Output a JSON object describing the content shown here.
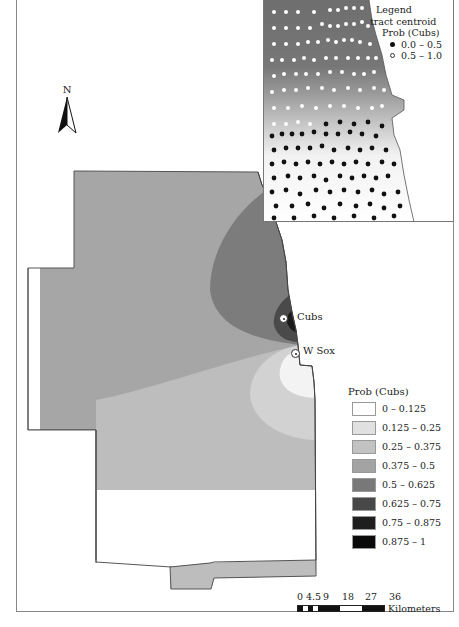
{
  "map": {
    "north_arrow": {
      "label": "N",
      "icon": "north-arrow-icon"
    },
    "stadiums": [
      {
        "name": "Cubs",
        "x": 284,
        "y": 319
      },
      {
        "name": "W Sox",
        "x": 296,
        "y": 354
      }
    ],
    "legend": {
      "title": "Prob (Cubs)",
      "classes": [
        {
          "label": "0 – 0.125",
          "color": "#ffffff"
        },
        {
          "label": "0.125 – 0.25",
          "color": "#e0e0e0"
        },
        {
          "label": "0.25 – 0.375",
          "color": "#c2c2c2"
        },
        {
          "label": "0.375 – 0.5",
          "color": "#a3a3a3"
        },
        {
          "label": "0.5 – 0.625",
          "color": "#787878"
        },
        {
          "label": "0.625 – 0.75",
          "color": "#484848"
        },
        {
          "label": "0.75 – 0.875",
          "color": "#1e1e1e"
        },
        {
          "label": "0.875 – 1",
          "color": "#0a0a0a"
        }
      ]
    },
    "scale": {
      "ticks": [
        "0",
        "4.5",
        "9",
        "18",
        "27",
        "36"
      ],
      "unit": "Kilometers"
    }
  },
  "inset": {
    "legend": {
      "title": "Legend",
      "subtitle": "tract centroid",
      "field": "Prob (Cubs)",
      "classes": [
        {
          "label": "0.0 – 0.5",
          "symbol": "black-dot"
        },
        {
          "label": "0.5 – 1.0",
          "symbol": "white-dot"
        }
      ]
    }
  }
}
